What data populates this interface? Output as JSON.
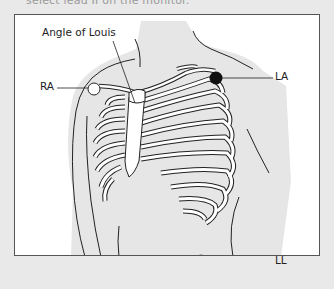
{
  "caption": "select lead II on the monitor.",
  "diagram": {
    "labels": {
      "angle_of_louis": "Angle of Louis",
      "ra": "RA",
      "la": "LA",
      "ll": "LL"
    },
    "electrodes": [
      {
        "id": "RA",
        "fill": "#ffffff"
      },
      {
        "id": "LA",
        "fill": "#111111"
      },
      {
        "id": "LL",
        "fill": "#666666"
      }
    ]
  }
}
